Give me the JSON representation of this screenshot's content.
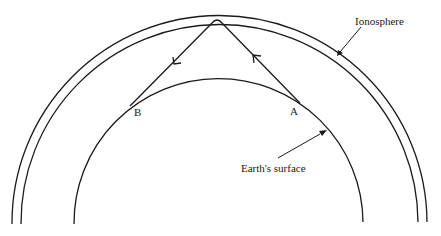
{
  "diagram": {
    "labels": {
      "ionosphere": "Ionosphere",
      "earth_surface": "Earth's surface",
      "point_a": "A",
      "point_b": "B"
    },
    "colors": {
      "stroke": "#1a1a1a",
      "background": "#ffffff"
    },
    "geometry": {
      "ionosphere_outer": {
        "cx": 219,
        "cy": 220,
        "r": 206
      },
      "ionosphere_inner": {
        "cx": 219,
        "cy": 221,
        "r": 197
      },
      "earth": {
        "cx": 218,
        "cy": 222,
        "r": 144
      },
      "ray_path": {
        "A": [
          295,
          98
        ],
        "apex": [
          217,
          20
        ],
        "B": [
          136,
          100
        ]
      }
    }
  }
}
